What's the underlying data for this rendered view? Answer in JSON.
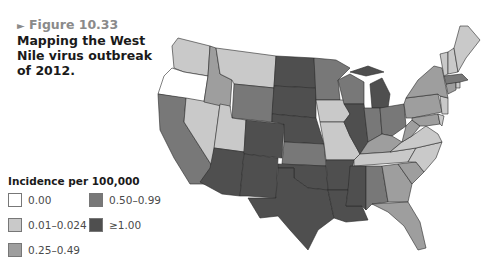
{
  "caption": {
    "arrow": "►",
    "figure_label": "Figure 10.33",
    "title": "Mapping the West Nile virus outbreak of 2012."
  },
  "legend": {
    "title": "Incidence per 100,000",
    "items": [
      {
        "label": "0.00",
        "color": "#ffffff"
      },
      {
        "label": "0.01–0.024",
        "color": "#c9c9c9"
      },
      {
        "label": "0.25–0.49",
        "color": "#9e9e9e"
      },
      {
        "label": "0.50–0.99",
        "color": "#787878"
      },
      {
        "label": "≥1.00",
        "color": "#4f4f4f"
      }
    ]
  },
  "map": {
    "type": "choropleth",
    "region": "Contiguous United States",
    "states": {
      "WA": "0.01–0.024",
      "OR": "0.00",
      "CA": "0.50–0.99",
      "NV": "0.01–0.024",
      "ID": "0.25–0.49",
      "MT": "0.01–0.024",
      "WY": "0.50–0.99",
      "UT": "0.01–0.024",
      "AZ": "≥1.00",
      "CO": "≥1.00",
      "NM": "≥1.00",
      "ND": "≥1.00",
      "SD": "≥1.00",
      "NE": "≥1.00",
      "KS": "0.50–0.99",
      "OK": "≥1.00",
      "TX": "≥1.00",
      "MN": "0.50–0.99",
      "IA": "0.01–0.024",
      "MO": "0.01–0.024",
      "AR": "≥1.00",
      "LA": "≥1.00",
      "WI": "0.50–0.99",
      "IL": "≥1.00",
      "MI": "≥1.00",
      "IN": "0.50–0.99",
      "OH": "0.50–0.99",
      "KY": "0.25–0.49",
      "TN": "0.01–0.024",
      "MS": "≥1.00",
      "AL": "0.50–0.99",
      "GA": "0.25–0.49",
      "FL": "0.25–0.49",
      "SC": "0.25–0.49",
      "NC": "0.01–0.024",
      "VA": "0.01–0.024",
      "WV": "0.25–0.49",
      "PA": "0.25–0.49",
      "NY": "0.25–0.49",
      "NJ": "0.01–0.024",
      "MD": "0.25–0.49",
      "DE": "0.01–0.024",
      "CT": "0.25–0.49",
      "RI": "0.01–0.024",
      "MA": "0.50–0.99",
      "VT": "0.01–0.024",
      "NH": "0.01–0.024",
      "ME": "0.01–0.024"
    }
  }
}
